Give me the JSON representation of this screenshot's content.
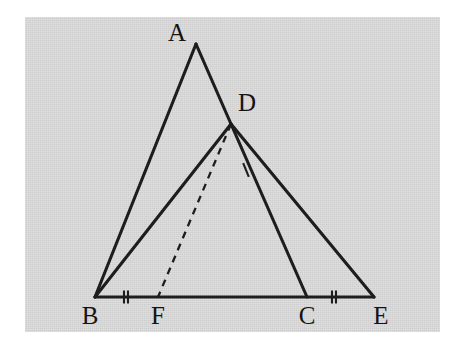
{
  "figure": {
    "background_color": "#d5d5d5",
    "page_color": "#ffffff",
    "stroke_color": "#1d1d1d",
    "plate": {
      "x": 25,
      "y": 17,
      "width": 415,
      "height": 315
    }
  },
  "points": {
    "A": {
      "label": "A",
      "x": 196,
      "y": 44,
      "label_x": 177,
      "label_y": 35
    },
    "B": {
      "label": "B",
      "x": 95,
      "y": 297,
      "label_x": 90,
      "label_y": 318
    },
    "C": {
      "label": "C",
      "x": 307,
      "y": 297,
      "label_x": 307,
      "label_y": 318
    },
    "D": {
      "label": "D",
      "x": 231,
      "y": 124,
      "label_x": 247,
      "label_y": 105
    },
    "E": {
      "label": "E",
      "x": 374,
      "y": 297,
      "label_x": 381,
      "label_y": 318
    },
    "F": {
      "label": "F",
      "x": 158,
      "y": 297,
      "label_x": 158,
      "label_y": 318
    }
  },
  "segments": [
    {
      "name": "segment-AB",
      "from": "A",
      "to": "B",
      "style": "solid",
      "ticks": 1
    },
    {
      "name": "segment-AD",
      "from": "A",
      "to": "D",
      "style": "solid",
      "ticks": 0
    },
    {
      "name": "segment-DC",
      "from": "D",
      "to": "C",
      "style": "solid",
      "ticks": 1
    },
    {
      "name": "segment-DE",
      "from": "D",
      "to": "E",
      "style": "solid",
      "ticks": 0
    },
    {
      "name": "segment-DB",
      "from": "D",
      "to": "B",
      "style": "solid",
      "ticks": 0
    },
    {
      "name": "segment-BE",
      "from": "B",
      "to": "E",
      "style": "solid",
      "ticks": 0
    },
    {
      "name": "segment-DF",
      "from": "D",
      "to": "F",
      "style": "dashed",
      "ticks": 0
    }
  ],
  "tick_marks": [
    {
      "name": "tick-AB-single",
      "on": "segment-AB",
      "x": 147,
      "y": 167,
      "count": 1,
      "angle": 112,
      "length": 15
    },
    {
      "name": "tick-DC-single",
      "on": "segment-DC",
      "x": 246,
      "y": 170,
      "count": 1,
      "angle": 68,
      "length": 15
    },
    {
      "name": "tick-BF-double",
      "on": "segment-BF",
      "x": 126,
      "y": 297,
      "count": 2,
      "angle": 90,
      "length": 13
    },
    {
      "name": "tick-CE-double",
      "on": "segment-CE",
      "x": 334,
      "y": 297,
      "count": 2,
      "angle": 90,
      "length": 13
    }
  ],
  "labels": {
    "A": "A",
    "B": "B",
    "C": "C",
    "D": "D",
    "E": "E",
    "F": "F"
  }
}
